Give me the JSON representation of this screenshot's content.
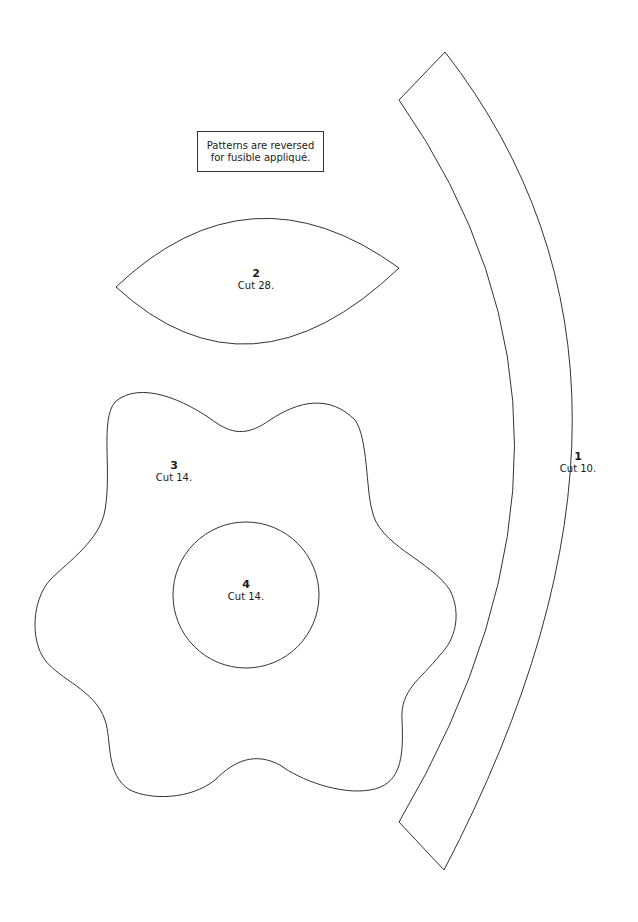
{
  "note": {
    "line1": "Patterns are reversed",
    "line2": "for fusible appliqué."
  },
  "pieces": [
    {
      "number": "1",
      "cut": "Cut 10.",
      "shape": "curved-band"
    },
    {
      "number": "2",
      "cut": "Cut 28.",
      "shape": "leaf"
    },
    {
      "number": "3",
      "cut": "Cut 14.",
      "shape": "flower"
    },
    {
      "number": "4",
      "cut": "Cut 14.",
      "shape": "circle"
    }
  ],
  "colors": {
    "stroke": "#333333",
    "background": "#ffffff"
  }
}
